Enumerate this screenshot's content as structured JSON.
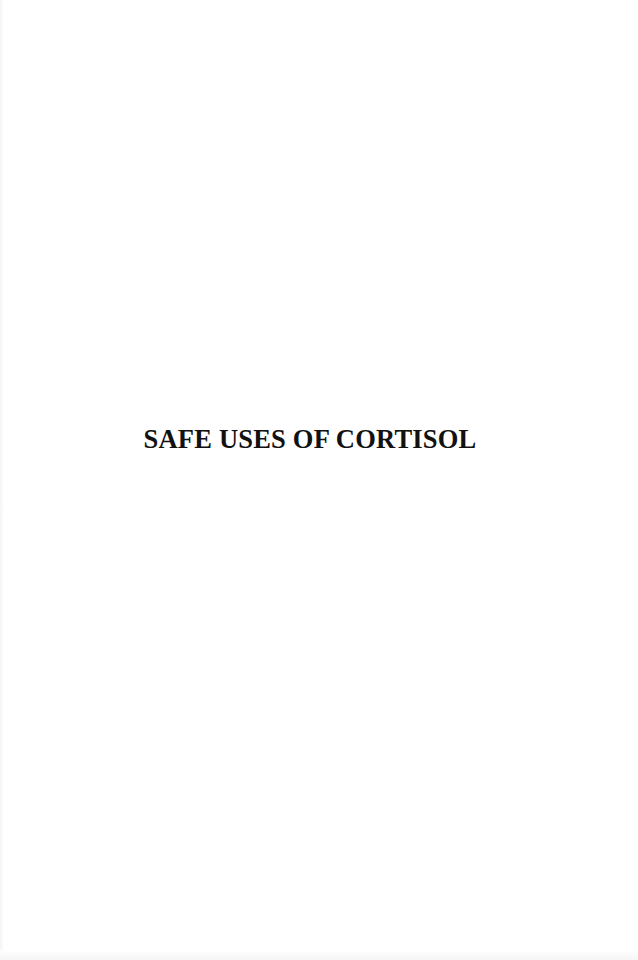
{
  "page": {
    "title": "SAFE USES OF CORTISOL",
    "background_color": "#ffffff",
    "text_color": "#111111"
  }
}
